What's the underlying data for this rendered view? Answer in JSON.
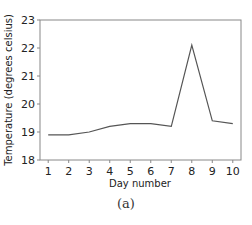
{
  "chart_data": {
    "type": "line",
    "title": "",
    "xlabel": "Day number",
    "ylabel": "Temperature (degrees celsius)",
    "x": [
      1,
      2,
      3,
      4,
      5,
      6,
      7,
      8,
      9,
      10
    ],
    "x_tick_labels": [
      "1",
      "2",
      "3",
      "4",
      "5",
      "6",
      "7",
      "8",
      "9",
      "10"
    ],
    "y_tick_labels": [
      "18",
      "19",
      "20",
      "21",
      "22",
      "23"
    ],
    "series": [
      {
        "name": "Temperature",
        "values": [
          18.9,
          18.9,
          19.0,
          19.2,
          19.3,
          19.3,
          19.2,
          22.1,
          19.4,
          19.3
        ],
        "color": "#555555"
      }
    ],
    "xlim": [
      0.6,
      10.4
    ],
    "ylim": [
      18,
      23
    ],
    "grid": false,
    "legend": null
  },
  "caption": "(a)"
}
